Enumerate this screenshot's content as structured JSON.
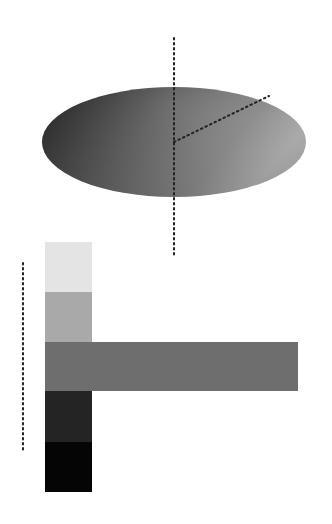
{
  "figure": {
    "disc": {
      "cx": 174,
      "cy": 142,
      "rx": 132,
      "ry": 55,
      "gradient": [
        "#2a2a2a",
        "#6b6b6b",
        "#9a9a9a",
        "#c4c4c4"
      ]
    },
    "axis_vertical": {
      "x": 174,
      "y1": 38,
      "y2": 257
    },
    "axis_radial": {
      "x1": 174,
      "y1": 142,
      "x2": 269,
      "y2": 96
    },
    "ruler_left": {
      "x": 23,
      "y1": 263,
      "y2": 450
    },
    "swatches": [
      {
        "name": "swatch-lightest",
        "color": "#e4e4e4",
        "x": 45,
        "y": 242,
        "w": 47,
        "h": 50
      },
      {
        "name": "swatch-light",
        "color": "#a9a9a9",
        "x": 45,
        "y": 292,
        "w": 47,
        "h": 50
      },
      {
        "name": "swatch-mid",
        "color": "#6e6e6e",
        "x": 45,
        "y": 342,
        "w": 253,
        "h": 49
      },
      {
        "name": "swatch-dark",
        "color": "#242424",
        "x": 45,
        "y": 391,
        "w": 47,
        "h": 51
      },
      {
        "name": "swatch-darkest",
        "color": "#050505",
        "x": 45,
        "y": 442,
        "w": 47,
        "h": 50
      }
    ]
  }
}
